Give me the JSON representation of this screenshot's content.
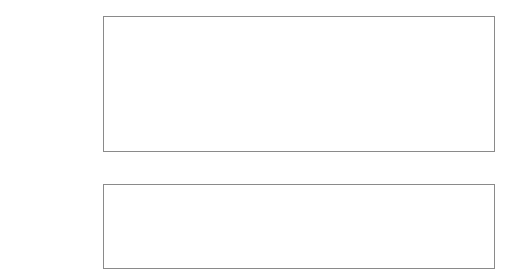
{
  "diagram": {
    "groups": [
      {
        "id": "stockperson",
        "label": "The stockperson"
      },
      {
        "id": "animal",
        "label": "The animal"
      }
    ],
    "nodes": {
      "lack_attention": "Lack of attention to\nroutine tasks, e.g.\ncleaning",
      "neg_beliefs_animals": "Negative\nbeliefs about\nanimals",
      "aversive_handling": "Use of\naversive\nhandling",
      "neg_beliefs_tasks": "Negative\nbeliefs about\nroutine tasks",
      "lack_cleanliness": "Lack of\ncleanliness",
      "poor_health": "Poor health",
      "reduced_growth": "Reduced growth",
      "fear_people": "Fear of\npeople"
    },
    "edges": [
      {
        "from": "neg_beliefs_animals",
        "to": "aversive_handling",
        "type": "arrow"
      },
      {
        "from": "neg_beliefs_animals",
        "to": "neg_beliefs_tasks",
        "type": "bidirectional"
      },
      {
        "from": "neg_beliefs_tasks",
        "to": "lack_attention",
        "type": "arrow"
      },
      {
        "from": "lack_attention",
        "to": "lack_cleanliness",
        "type": "arrow"
      },
      {
        "from": "aversive_handling",
        "to": "fear_people",
        "type": "arrow"
      },
      {
        "from": "lack_cleanliness",
        "to": "poor_health",
        "type": "arrow"
      },
      {
        "from": "poor_health",
        "to": "reduced_growth",
        "type": "arrow"
      }
    ],
    "colors": {
      "text": "#3a3a3a",
      "border": "#8a8a8a",
      "arrow": "#3a3a3a"
    }
  }
}
